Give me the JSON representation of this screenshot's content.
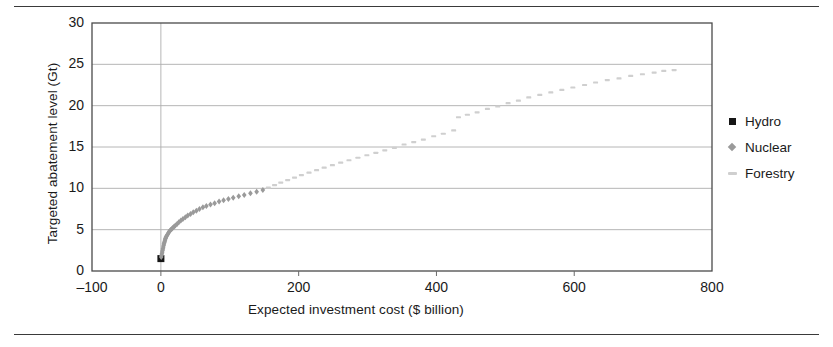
{
  "figure": {
    "top_rule": "",
    "bottom_rule": ""
  },
  "legend": {
    "position": "right",
    "items": [
      {
        "label": "Hydro",
        "marker": "square-marker-icon",
        "color": "#161616"
      },
      {
        "label": "Nuclear",
        "marker": "diamond-marker-icon",
        "color": "#9a9a9a"
      },
      {
        "label": "Forestry",
        "marker": "dash-marker-icon",
        "color": "#cfcfcf"
      }
    ]
  },
  "chart_data": {
    "type": "scatter",
    "title": "",
    "xlabel": "Expected investment cost ($ billion)",
    "ylabel": "Targeted abatement level (Gt)",
    "xlim": [
      -100,
      800
    ],
    "ylim": [
      0,
      30
    ],
    "xticks": [
      -100,
      0,
      200,
      400,
      600,
      800
    ],
    "yticks": [
      0,
      5,
      10,
      15,
      20,
      25,
      30
    ],
    "grid": {
      "x": [
        0
      ],
      "y": [
        5,
        10,
        15,
        20,
        25
      ]
    },
    "legend_position": "right",
    "series": [
      {
        "name": "Hydro",
        "marker": "square",
        "color": "#161616",
        "marker_size": 7,
        "points": [
          [
            0,
            1.5
          ]
        ]
      },
      {
        "name": "Nuclear",
        "marker": "diamond",
        "color": "#9a9a9a",
        "marker_size": 6,
        "points": [
          [
            0.5,
            1.7
          ],
          [
            1.0,
            1.9
          ],
          [
            1.5,
            2.1
          ],
          [
            2.0,
            2.3
          ],
          [
            2.5,
            2.5
          ],
          [
            3.0,
            2.7
          ],
          [
            3.5,
            2.9
          ],
          [
            4.0,
            3.1
          ],
          [
            4.5,
            3.3
          ],
          [
            5.0,
            3.45
          ],
          [
            5.5,
            3.6
          ],
          [
            6.0,
            3.75
          ],
          [
            6.5,
            3.9
          ],
          [
            7.0,
            4.0
          ],
          [
            7.5,
            4.1
          ],
          [
            8.5,
            4.25
          ],
          [
            9.5,
            4.4
          ],
          [
            10.5,
            4.55
          ],
          [
            11.5,
            4.7
          ],
          [
            12.5,
            4.8
          ],
          [
            14.0,
            4.95
          ],
          [
            15.5,
            5.05
          ],
          [
            17.0,
            5.2
          ],
          [
            19.0,
            5.35
          ],
          [
            21.0,
            5.5
          ],
          [
            23.5,
            5.7
          ],
          [
            26.0,
            5.9
          ],
          [
            29.0,
            6.1
          ],
          [
            32.0,
            6.3
          ],
          [
            35.5,
            6.5
          ],
          [
            39.0,
            6.7
          ],
          [
            43.0,
            6.9
          ],
          [
            47.0,
            7.1
          ],
          [
            51.5,
            7.3
          ],
          [
            56.0,
            7.5
          ],
          [
            61.0,
            7.7
          ],
          [
            66.0,
            7.85
          ],
          [
            72.0,
            8.05
          ],
          [
            78.0,
            8.2
          ],
          [
            84.5,
            8.4
          ],
          [
            91.0,
            8.55
          ],
          [
            98.0,
            8.7
          ],
          [
            105.0,
            8.85
          ],
          [
            113.0,
            9.05
          ],
          [
            121.0,
            9.2
          ],
          [
            130.0,
            9.4
          ],
          [
            139.0,
            9.6
          ],
          [
            148.0,
            9.8
          ]
        ]
      },
      {
        "name": "Forestry",
        "marker": "dash",
        "color": "#cfcfcf",
        "marker_size": 5,
        "points": [
          [
            156,
            10.1
          ],
          [
            165,
            10.4
          ],
          [
            174,
            10.7
          ],
          [
            184,
            11.0
          ],
          [
            194,
            11.3
          ],
          [
            204,
            11.6
          ],
          [
            215,
            11.9
          ],
          [
            226,
            12.2
          ],
          [
            237,
            12.5
          ],
          [
            249,
            12.8
          ],
          [
            261,
            13.1
          ],
          [
            273,
            13.4
          ],
          [
            286,
            13.7
          ],
          [
            299,
            14.0
          ],
          [
            312,
            14.3
          ],
          [
            325,
            14.6
          ],
          [
            339,
            14.9
          ],
          [
            353,
            15.3
          ],
          [
            367,
            15.6
          ],
          [
            381,
            15.9
          ],
          [
            396,
            16.3
          ],
          [
            410,
            16.6
          ],
          [
            425,
            17.0
          ],
          [
            432,
            18.6
          ],
          [
            445,
            18.9
          ],
          [
            459,
            19.2
          ],
          [
            474,
            19.6
          ],
          [
            489,
            19.9
          ],
          [
            504,
            20.3
          ],
          [
            519,
            20.6
          ],
          [
            534,
            21.0
          ],
          [
            550,
            21.3
          ],
          [
            566,
            21.6
          ],
          [
            582,
            21.9
          ],
          [
            598,
            22.2
          ],
          [
            615,
            22.5
          ],
          [
            631,
            22.8
          ],
          [
            648,
            23.1
          ],
          [
            665,
            23.3
          ],
          [
            682,
            23.6
          ],
          [
            699,
            23.8
          ],
          [
            716,
            24.0
          ],
          [
            730,
            24.2
          ],
          [
            745,
            24.3
          ]
        ]
      }
    ]
  }
}
